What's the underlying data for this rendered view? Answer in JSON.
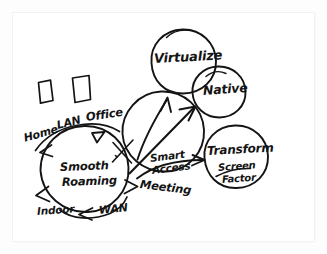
{
  "canvas": {
    "title": "Smooth Roaming whiteboard sketch",
    "background_color": "#fdfdfe",
    "paper_color": "#ffffff",
    "ink_color": "#141414"
  },
  "nodes": {
    "smooth_roaming": {
      "label_line1": "Smooth",
      "label_line2": "Roaming"
    },
    "smart_access": {
      "label_line1": "Smart",
      "label_line2": "Access"
    },
    "virtualize": {
      "label": "Virtualize"
    },
    "native": {
      "label": "Native"
    },
    "transform": {
      "label": "Transform",
      "sub_line1": "Screen",
      "sub_line2": "Factor"
    }
  },
  "roaming_ring_labels": {
    "home": "Home",
    "lan": "LAN",
    "office": "Office",
    "meeting": "Meeting",
    "wan": "WAN",
    "indoor": "Indoor"
  },
  "shapes": {
    "rect_left": "hand-drawn-quadrilateral",
    "rect_right": "hand-drawn-quadrilateral"
  },
  "arrows": {
    "to_virtualize": "arrow-up",
    "to_native": "arrow-diagonal",
    "to_transform": "arrow-right"
  }
}
